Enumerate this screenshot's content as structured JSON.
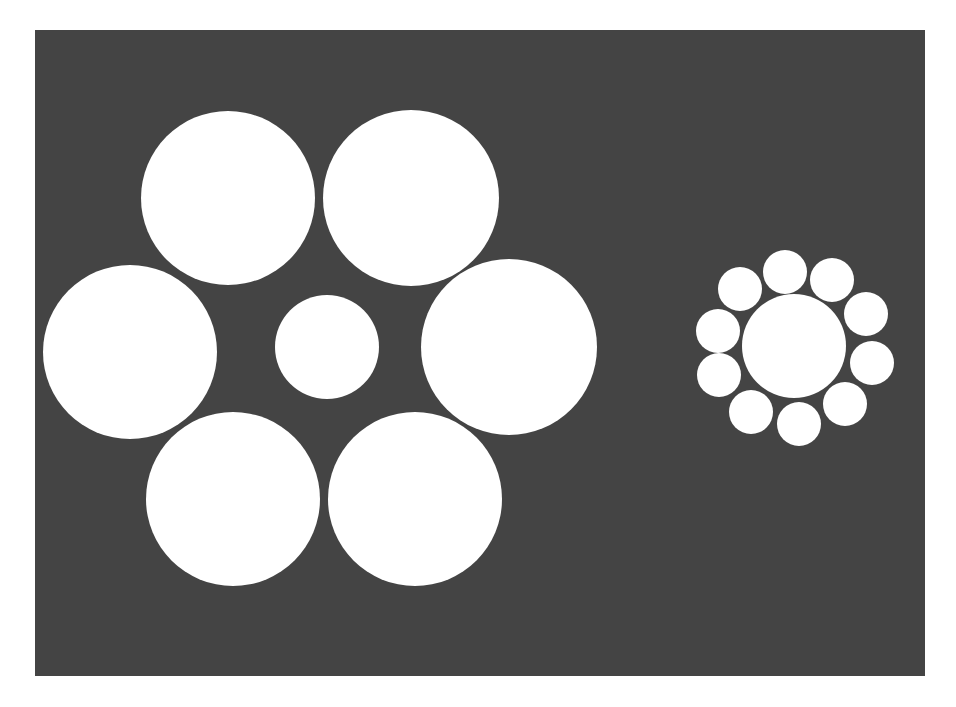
{
  "figure": {
    "background_color": "#ffffff",
    "panel": {
      "x": 35,
      "y": 30,
      "width": 890,
      "height": 646,
      "color": "#444444"
    },
    "circle_color": "#ffffff",
    "left_cluster": {
      "name": "large-surround",
      "center": {
        "cx": 327,
        "cy": 347,
        "r": 52
      },
      "surrounding": [
        {
          "cx": 228,
          "cy": 198,
          "r": 87
        },
        {
          "cx": 411,
          "cy": 198,
          "r": 88
        },
        {
          "cx": 130,
          "cy": 352,
          "r": 87
        },
        {
          "cx": 509,
          "cy": 347,
          "r": 88
        },
        {
          "cx": 233,
          "cy": 499,
          "r": 87
        },
        {
          "cx": 415,
          "cy": 499,
          "r": 87
        }
      ]
    },
    "right_cluster": {
      "name": "small-surround",
      "center": {
        "cx": 794,
        "cy": 346,
        "r": 52
      },
      "surrounding": [
        {
          "cx": 785,
          "cy": 272,
          "r": 22
        },
        {
          "cx": 832,
          "cy": 280,
          "r": 22
        },
        {
          "cx": 866,
          "cy": 314,
          "r": 22
        },
        {
          "cx": 872,
          "cy": 363,
          "r": 22
        },
        {
          "cx": 845,
          "cy": 404,
          "r": 22
        },
        {
          "cx": 799,
          "cy": 424,
          "r": 22
        },
        {
          "cx": 751,
          "cy": 412,
          "r": 22
        },
        {
          "cx": 719,
          "cy": 375,
          "r": 22
        },
        {
          "cx": 718,
          "cy": 331,
          "r": 22
        },
        {
          "cx": 740,
          "cy": 289,
          "r": 22
        }
      ]
    }
  }
}
